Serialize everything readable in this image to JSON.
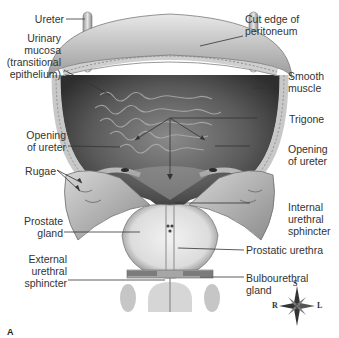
{
  "figure": {
    "panel_letter": "A",
    "labels_left": [
      {
        "id": "ureter",
        "text": "Ureter"
      },
      {
        "id": "urinary-mucosa",
        "text": "Urinary\nmucosa\n(transitional\nepithelium)"
      },
      {
        "id": "opening-of-ureter-left",
        "text": "Opening\nof ureter"
      },
      {
        "id": "rugae",
        "text": "Rugae"
      },
      {
        "id": "prostate-gland",
        "text": "Prostate\ngland"
      },
      {
        "id": "external-urethral-sphincter",
        "text": "External\nurethral\nsphincter"
      }
    ],
    "labels_right": [
      {
        "id": "cut-edge-of-peritoneum",
        "text": "Cut edge of\nperitoneum"
      },
      {
        "id": "smooth-muscle",
        "text": "Smooth\nmuscle"
      },
      {
        "id": "trigone",
        "text": "Trigone"
      },
      {
        "id": "opening-of-ureter-right",
        "text": "Opening\nof ureter"
      },
      {
        "id": "internal-urethral-sphincter",
        "text": "Internal\nurethral\nsphincter"
      },
      {
        "id": "prostatic-urethra",
        "text": "Prostatic urethra"
      },
      {
        "id": "bulbourethral-gland",
        "text": "Bulbourethral\ngland"
      }
    ],
    "compass": {
      "top": "S",
      "left": "R",
      "right": "L",
      "bottom": "I"
    },
    "colors": {
      "tissue_light": "#d9d9d9",
      "tissue_mid": "#a8a8a8",
      "tissue_dark": "#5a5a5a",
      "interior_dark": "#3a3a3a",
      "leader_line": "#333333"
    }
  }
}
